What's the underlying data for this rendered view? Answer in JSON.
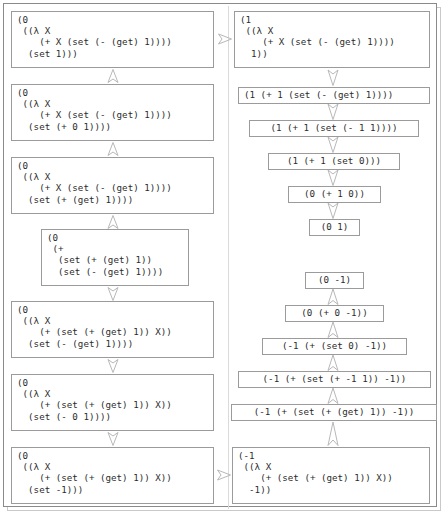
{
  "figure": {
    "frame_color": "#8a8a8a",
    "box_border_color": "#9b9b9b",
    "text_color": "#2b2b2b",
    "background": "#ffffff"
  },
  "left_column": {
    "nodes": [
      {
        "id": "L1",
        "text": "(0\n ((λ X\n    (+ X (set (- (get) 1))))\n  (set 1)))"
      },
      {
        "id": "L2",
        "text": "(0\n ((λ X\n    (+ X (set (- (get) 1))))\n  (set (+ 0 1))))"
      },
      {
        "id": "L3",
        "text": "(0\n ((λ X\n    (+ X (set (- (get) 1))))\n  (set (+ (get) 1))))"
      },
      {
        "id": "L4",
        "text": "(0\n (+\n  (set (+ (get) 1))\n  (set (- (get) 1))))"
      },
      {
        "id": "L5",
        "text": "(0\n ((λ X\n    (+ (set (+ (get) 1)) X))\n  (set (- (get) 1))))"
      },
      {
        "id": "L6",
        "text": "(0\n ((λ X\n    (+ (set (+ (get) 1)) X))\n  (set (- 0 1))))"
      },
      {
        "id": "L7",
        "text": "(0\n ((λ X\n    (+ (set (+ (get) 1)) X))\n  (set -1)))"
      }
    ]
  },
  "right_column": {
    "nodes": [
      {
        "id": "R1",
        "text": "(1\n ((λ X\n    (+ X (set (- (get) 1))))\n  1))"
      },
      {
        "id": "R2",
        "text": "(1 (+ 1 (set (- (get) 1))))"
      },
      {
        "id": "R3",
        "text": "(1 (+ 1 (set (- 1 1))))"
      },
      {
        "id": "R4",
        "text": "(1 (+ 1 (set 0)))"
      },
      {
        "id": "R5",
        "text": "(0 (+ 1 0))"
      },
      {
        "id": "R6",
        "text": "(0 1)"
      },
      {
        "id": "R7",
        "text": "(0 -1)"
      },
      {
        "id": "R8",
        "text": "(0 (+ 0 -1))"
      },
      {
        "id": "R9",
        "text": "(-1 (+ (set 0) -1))"
      },
      {
        "id": "R10",
        "text": "(-1 (+ (set (+ -1 1)) -1))"
      },
      {
        "id": "R11",
        "text": "(-1 (+ (set (+ (get) 1)) -1))"
      },
      {
        "id": "R12",
        "text": "(-1\n ((λ X\n    (+ (set (+ (get) 1)) X))\n  -1))"
      }
    ]
  },
  "arrows": [
    {
      "id": "A-L1-L2",
      "direction": "up",
      "from": "L2",
      "to": "L1"
    },
    {
      "id": "A-L2-L3",
      "direction": "up",
      "from": "L3",
      "to": "L2"
    },
    {
      "id": "A-L3-L4",
      "direction": "up",
      "from": "L4",
      "to": "L3"
    },
    {
      "id": "A-L4-L5",
      "direction": "down",
      "from": "L4",
      "to": "L5"
    },
    {
      "id": "A-L5-L6",
      "direction": "down",
      "from": "L5",
      "to": "L6"
    },
    {
      "id": "A-L6-L7",
      "direction": "down",
      "from": "L6",
      "to": "L7"
    },
    {
      "id": "A-L1-R1",
      "direction": "right",
      "from": "L1",
      "to": "R1"
    },
    {
      "id": "A-R1-R2",
      "direction": "down",
      "from": "R1",
      "to": "R2"
    },
    {
      "id": "A-R2-R3",
      "direction": "down",
      "from": "R2",
      "to": "R3"
    },
    {
      "id": "A-R3-R4",
      "direction": "down",
      "from": "R3",
      "to": "R4"
    },
    {
      "id": "A-R4-R5",
      "direction": "down",
      "from": "R4",
      "to": "R5"
    },
    {
      "id": "A-R5-R6",
      "direction": "down",
      "from": "R5",
      "to": "R6"
    },
    {
      "id": "A-R7-R8",
      "direction": "up",
      "from": "R8",
      "to": "R7"
    },
    {
      "id": "A-R8-R9",
      "direction": "up",
      "from": "R9",
      "to": "R8"
    },
    {
      "id": "A-R9-R10",
      "direction": "up",
      "from": "R10",
      "to": "R9"
    },
    {
      "id": "A-R10-R11",
      "direction": "up",
      "from": "R11",
      "to": "R10"
    },
    {
      "id": "A-R11-R12",
      "direction": "up",
      "from": "R12",
      "to": "R11"
    },
    {
      "id": "A-L7-R12",
      "direction": "right",
      "from": "L7",
      "to": "R12"
    }
  ]
}
